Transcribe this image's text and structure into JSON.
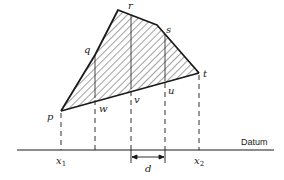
{
  "figure": {
    "type": "cross-section area diagram",
    "vertices": {
      "p": "p",
      "q": "q",
      "r": "r",
      "s": "s",
      "t": "t"
    },
    "base_points": {
      "w": "w",
      "v": "v",
      "u": "u"
    },
    "datum_label": "Datum",
    "x1_label": "x",
    "x1_sub": "1",
    "x2_label": "x",
    "x2_sub": "2",
    "interval_label": "d",
    "colors": {
      "line": "#1a1a1a",
      "hatch": "#444444",
      "background": "#ffffff"
    }
  }
}
